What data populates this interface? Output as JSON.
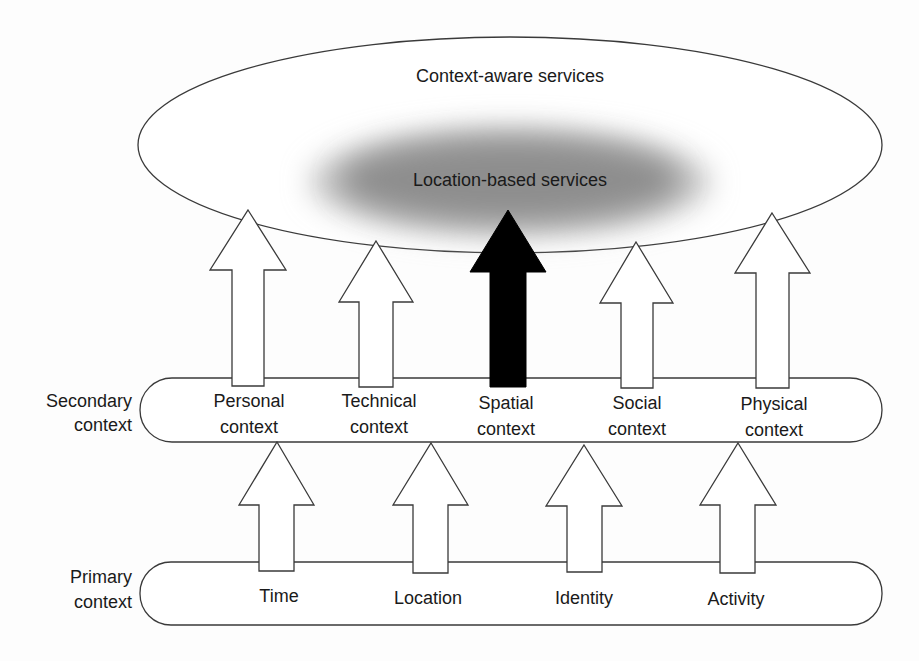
{
  "diagram": {
    "outer_ellipse": {
      "label": "Context-aware services"
    },
    "inner_ellipse": {
      "label": "Location-based services",
      "fill": "#8c8c8c"
    },
    "secondary": {
      "side_label": [
        "Secondary",
        "context"
      ],
      "items": [
        {
          "line1": "Personal",
          "line2": "context"
        },
        {
          "line1": "Technical",
          "line2": "context"
        },
        {
          "line1": "Spatial",
          "line2": "context",
          "highlighted": true
        },
        {
          "line1": "Social",
          "line2": "context"
        },
        {
          "line1": "Physical",
          "line2": "context"
        }
      ]
    },
    "primary": {
      "side_label": [
        "Primary",
        "context"
      ],
      "items": [
        "Time",
        "Location",
        "Identity",
        "Activity"
      ]
    },
    "colors": {
      "line": "#3a3a3a",
      "highlight_arrow": "#000000",
      "gray_ellipse": "#8c8c8c"
    }
  }
}
